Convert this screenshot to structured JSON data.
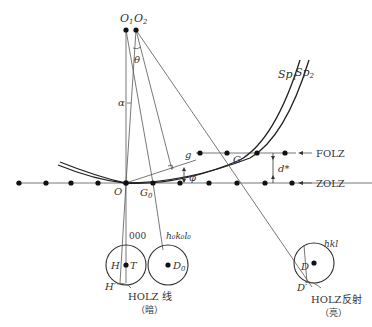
{
  "diagram": {
    "title": "",
    "points": {
      "O1": "O",
      "O1_sub": "1",
      "O2": "O",
      "O2_sub": "2",
      "O": "O",
      "G0": "G",
      "G0_sub": "0",
      "G": "G",
      "g": "g",
      "H": "H",
      "H_prime": "H′",
      "T": "T",
      "D0": "D",
      "D0_sub": "0",
      "D": "D",
      "D_prime": "D′"
    },
    "angles": {
      "theta": "θ",
      "alpha": "α",
      "phi": "φ"
    },
    "spheres": {
      "sp1": "Sp",
      "sp1_sub": "1",
      "sp2": "Sp",
      "sp2_sub": "2"
    },
    "layers": {
      "folz": "FOLZ",
      "zolz": "ZOLZ",
      "spacing": "d*"
    },
    "disks": {
      "transmitted_index": "000",
      "zero_layer_index": "h₀k₀l₀",
      "hkl_index": "hkl"
    },
    "captions": {
      "holz_line": "HOLZ 线",
      "holz_line_note": "（暗）",
      "holz_reflection": "HOLZ反射",
      "holz_reflection_note": "（亮）"
    }
  }
}
